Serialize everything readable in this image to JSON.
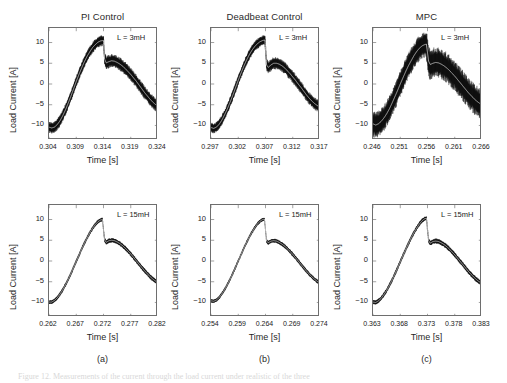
{
  "figure": {
    "caption_partial": "Figure 12. Measurements of the current through the load current under realistic of the three",
    "subcaptions": [
      "(a)",
      "(b)",
      "(c)"
    ],
    "axis_labels": {
      "x": "Time [s]",
      "y": "Load Current [A]"
    },
    "column_titles": [
      "PI Control",
      "Deadbeat Control",
      "MPC"
    ]
  },
  "chart_data": [
    {
      "id": "pi-3mh",
      "type": "line",
      "title": "PI Control",
      "annotation": "L = 3mH",
      "xlabel": "Time [s]",
      "ylabel": "Load Current [A]",
      "xlim": [
        0.304,
        0.324
      ],
      "ylim": [
        -13.5,
        13.5
      ],
      "xticks": [
        0.304,
        0.309,
        0.314,
        0.319,
        0.324
      ],
      "xticklabels": [
        "0.304",
        "0.309",
        "0.314",
        "0.319",
        "0.324"
      ],
      "yticks": [
        -10,
        -5,
        0,
        5,
        10
      ],
      "yticklabels": [
        "-10",
        "-5",
        "0",
        "5",
        "10"
      ],
      "grid": false,
      "ripple_amplitude": 1.3,
      "series": [
        {
          "name": "load current",
          "x": [
            0.304,
            0.3045,
            0.305,
            0.3055,
            0.306,
            0.3065,
            0.307,
            0.3075,
            0.308,
            0.3085,
            0.309,
            0.3095,
            0.31,
            0.3105,
            0.311,
            0.3115,
            0.312,
            0.3125,
            0.313,
            0.3135,
            0.314,
            0.3142,
            0.3145,
            0.315,
            0.3155,
            0.316,
            0.3165,
            0.317,
            0.3175,
            0.318,
            0.3185,
            0.319,
            0.3195,
            0.32,
            0.3205,
            0.321,
            0.3215,
            0.322,
            0.3225,
            0.323,
            0.3235,
            0.324
          ],
          "y": [
            -10.4,
            -10.6,
            -10.4,
            -9.8,
            -8.9,
            -7.7,
            -6.3,
            -4.7,
            -3.0,
            -1.2,
            0.6,
            2.3,
            3.9,
            5.4,
            6.7,
            7.8,
            8.8,
            9.5,
            10.1,
            10.4,
            10.5,
            6.0,
            5.1,
            5.4,
            5.6,
            5.5,
            5.2,
            4.8,
            4.3,
            3.7,
            3.0,
            2.3,
            1.5,
            0.7,
            -0.2,
            -1.1,
            -2.0,
            -2.8,
            -3.6,
            -4.3,
            -4.9,
            -5.4
          ]
        }
      ]
    },
    {
      "id": "deadbeat-3mh",
      "type": "line",
      "title": "Deadbeat Control",
      "annotation": "L = 3mH",
      "xlabel": "Time [s]",
      "ylabel": "Load Current [A]",
      "xlim": [
        0.297,
        0.317
      ],
      "ylim": [
        -13.5,
        13.5
      ],
      "xticks": [
        0.297,
        0.302,
        0.307,
        0.312,
        0.317
      ],
      "xticklabels": [
        "0.297",
        "0.302",
        "0.307",
        "0.312",
        "0.317"
      ],
      "yticks": [
        -10,
        -5,
        0,
        5,
        10
      ],
      "yticklabels": [
        "-10",
        "-5",
        "0",
        "5",
        "10"
      ],
      "grid": false,
      "ripple_amplitude": 1.2,
      "series": [
        {
          "name": "load current",
          "x": [
            0.297,
            0.2975,
            0.298,
            0.2985,
            0.299,
            0.2995,
            0.3,
            0.3005,
            0.301,
            0.3015,
            0.302,
            0.3025,
            0.303,
            0.3035,
            0.304,
            0.3045,
            0.305,
            0.3055,
            0.306,
            0.3065,
            0.3069,
            0.3072,
            0.3075,
            0.308,
            0.3085,
            0.309,
            0.3095,
            0.31,
            0.3105,
            0.311,
            0.3115,
            0.312,
            0.3125,
            0.313,
            0.3135,
            0.314,
            0.3145,
            0.315,
            0.3155,
            0.316,
            0.3165,
            0.317
          ],
          "y": [
            -10.5,
            -10.7,
            -10.4,
            -9.7,
            -8.7,
            -7.4,
            -6.0,
            -4.4,
            -2.7,
            -0.9,
            0.9,
            2.6,
            4.2,
            5.7,
            7.0,
            8.1,
            9.0,
            9.7,
            10.2,
            10.5,
            10.6,
            4.6,
            4.0,
            4.6,
            5.0,
            5.0,
            4.8,
            4.4,
            3.9,
            3.2,
            2.5,
            1.7,
            0.9,
            0.0,
            -0.8,
            -1.7,
            -2.6,
            -3.4,
            -4.1,
            -4.7,
            -5.2,
            -5.5
          ]
        }
      ]
    },
    {
      "id": "mpc-3mh",
      "type": "line",
      "title": "MPC",
      "annotation": "L = 3mH",
      "xlabel": "Time [s]",
      "ylabel": "Load Current [A]",
      "xlim": [
        0.246,
        0.266
      ],
      "ylim": [
        -13.5,
        13.5
      ],
      "xticks": [
        0.246,
        0.251,
        0.256,
        0.261,
        0.266
      ],
      "xticklabels": [
        "0.246",
        "0.251",
        "0.256",
        "0.261",
        "0.266"
      ],
      "yticks": [
        -10,
        -5,
        0,
        5,
        10
      ],
      "yticklabels": [
        "-10",
        "-5",
        "0",
        "5",
        "10"
      ],
      "grid": false,
      "ripple_amplitude": 3.0,
      "series": [
        {
          "name": "load current",
          "x": [
            0.246,
            0.2465,
            0.247,
            0.2475,
            0.248,
            0.2485,
            0.249,
            0.2495,
            0.25,
            0.2505,
            0.251,
            0.2515,
            0.252,
            0.2525,
            0.253,
            0.2535,
            0.254,
            0.2545,
            0.255,
            0.2555,
            0.2558,
            0.2562,
            0.2565,
            0.257,
            0.2575,
            0.258,
            0.2585,
            0.259,
            0.2595,
            0.26,
            0.2605,
            0.261,
            0.2615,
            0.262,
            0.2625,
            0.263,
            0.2635,
            0.264,
            0.2645,
            0.265,
            0.2655,
            0.266
          ],
          "y": [
            -9.6,
            -9.9,
            -9.6,
            -9.0,
            -8.2,
            -7.2,
            -6.0,
            -4.6,
            -3.1,
            -1.6,
            0.0,
            1.5,
            3.0,
            4.4,
            5.6,
            6.8,
            7.8,
            8.6,
            9.2,
            9.5,
            9.6,
            5.5,
            4.7,
            5.0,
            5.2,
            5.1,
            4.8,
            4.4,
            3.9,
            3.3,
            2.6,
            1.9,
            1.1,
            0.3,
            -0.5,
            -1.3,
            -2.1,
            -2.8,
            -3.5,
            -4.1,
            -4.6,
            -5.0
          ]
        }
      ]
    },
    {
      "id": "pi-15mh",
      "type": "line",
      "title": "PI Control",
      "annotation": "L = 15mH",
      "xlabel": "Time [s]",
      "ylabel": "Load Current [A]",
      "xlim": [
        0.262,
        0.282
      ],
      "ylim": [
        -13.5,
        13.5
      ],
      "xticks": [
        0.262,
        0.267,
        0.272,
        0.277,
        0.282
      ],
      "xticklabels": [
        "0.262",
        "0.267",
        "0.272",
        "0.277",
        "0.282"
      ],
      "yticks": [
        -10,
        -5,
        0,
        5,
        10
      ],
      "yticklabels": [
        "-10",
        "-5",
        "0",
        "5",
        "10"
      ],
      "grid": false,
      "ripple_amplitude": 0.45,
      "series": [
        {
          "name": "load current",
          "x": [
            0.262,
            0.2625,
            0.263,
            0.2635,
            0.264,
            0.2645,
            0.265,
            0.2655,
            0.266,
            0.2665,
            0.267,
            0.2675,
            0.268,
            0.2685,
            0.269,
            0.2695,
            0.27,
            0.2705,
            0.271,
            0.2715,
            0.2718,
            0.2722,
            0.2725,
            0.273,
            0.2735,
            0.274,
            0.2745,
            0.275,
            0.2755,
            0.276,
            0.2765,
            0.277,
            0.2775,
            0.278,
            0.2785,
            0.279,
            0.2795,
            0.28,
            0.2805,
            0.281,
            0.2815,
            0.282
          ],
          "y": [
            -9.9,
            -9.9,
            -9.5,
            -8.9,
            -8.0,
            -7.0,
            -5.8,
            -4.5,
            -3.1,
            -1.6,
            -0.1,
            1.4,
            2.9,
            4.3,
            5.6,
            6.8,
            7.9,
            8.8,
            9.5,
            9.9,
            10.0,
            5.1,
            4.5,
            4.9,
            5.0,
            4.9,
            4.6,
            4.2,
            3.7,
            3.1,
            2.4,
            1.7,
            0.9,
            0.1,
            -0.7,
            -1.5,
            -2.3,
            -3.0,
            -3.7,
            -4.3,
            -4.8,
            -5.1
          ]
        }
      ]
    },
    {
      "id": "deadbeat-15mh",
      "type": "line",
      "title": "Deadbeat Control",
      "annotation": "L = 15mH",
      "xlabel": "Time [s]",
      "ylabel": "Load Current [A]",
      "xlim": [
        0.254,
        0.274
      ],
      "ylim": [
        -13.5,
        13.5
      ],
      "xticks": [
        0.254,
        0.259,
        0.264,
        0.269,
        0.274
      ],
      "xticklabels": [
        "0.254",
        "0.259",
        "0.264",
        "0.269",
        "0.274"
      ],
      "yticks": [
        -10,
        -5,
        0,
        5,
        10
      ],
      "yticklabels": [
        "-10",
        "-5",
        "0",
        "5",
        "10"
      ],
      "grid": false,
      "ripple_amplitude": 0.4,
      "series": [
        {
          "name": "load current",
          "x": [
            0.254,
            0.2545,
            0.255,
            0.2555,
            0.256,
            0.2565,
            0.257,
            0.2575,
            0.258,
            0.2585,
            0.259,
            0.2595,
            0.26,
            0.2605,
            0.261,
            0.2615,
            0.262,
            0.2625,
            0.263,
            0.2635,
            0.2638,
            0.2642,
            0.2645,
            0.265,
            0.2655,
            0.266,
            0.2665,
            0.267,
            0.2675,
            0.268,
            0.2685,
            0.269,
            0.2695,
            0.27,
            0.2705,
            0.271,
            0.2715,
            0.272,
            0.2725,
            0.273,
            0.2735,
            0.274
          ],
          "y": [
            -9.6,
            -9.7,
            -9.4,
            -8.8,
            -7.9,
            -6.9,
            -5.7,
            -4.4,
            -3.0,
            -1.5,
            0.0,
            1.5,
            3.0,
            4.4,
            5.7,
            6.9,
            8.0,
            8.9,
            9.6,
            10.0,
            10.1,
            4.8,
            4.4,
            4.8,
            4.9,
            4.8,
            4.5,
            4.1,
            3.6,
            3.0,
            2.3,
            1.6,
            0.8,
            0.0,
            -0.8,
            -1.6,
            -2.4,
            -3.1,
            -3.8,
            -4.4,
            -4.9,
            -5.2
          ]
        }
      ]
    },
    {
      "id": "mpc-15mh",
      "type": "line",
      "title": "MPC",
      "annotation": "L = 15mH",
      "xlabel": "Time [s]",
      "ylabel": "Load Current [A]",
      "xlim": [
        0.363,
        0.383
      ],
      "ylim": [
        -13.5,
        13.5
      ],
      "xticks": [
        0.363,
        0.368,
        0.373,
        0.378,
        0.383
      ],
      "xticklabels": [
        "0.363",
        "0.368",
        "0.373",
        "0.378",
        "0.383"
      ],
      "yticks": [
        -10,
        -5,
        0,
        5,
        10
      ],
      "yticklabels": [
        "-10",
        "-5",
        "0",
        "5",
        "10"
      ],
      "grid": false,
      "ripple_amplitude": 0.5,
      "series": [
        {
          "name": "load current",
          "x": [
            0.363,
            0.3635,
            0.364,
            0.3645,
            0.365,
            0.3655,
            0.366,
            0.3665,
            0.367,
            0.3675,
            0.368,
            0.3685,
            0.369,
            0.3695,
            0.37,
            0.3705,
            0.371,
            0.3715,
            0.372,
            0.3725,
            0.3728,
            0.3732,
            0.3735,
            0.374,
            0.3745,
            0.375,
            0.3755,
            0.376,
            0.3765,
            0.377,
            0.3775,
            0.378,
            0.3785,
            0.379,
            0.3795,
            0.38,
            0.3805,
            0.381,
            0.3815,
            0.382,
            0.3825,
            0.383
          ],
          "y": [
            -9.9,
            -10.0,
            -9.6,
            -9.0,
            -8.1,
            -7.1,
            -5.9,
            -4.6,
            -3.2,
            -1.7,
            -0.2,
            1.3,
            2.8,
            4.2,
            5.6,
            6.8,
            7.9,
            8.9,
            9.7,
            10.2,
            10.3,
            4.9,
            4.3,
            4.7,
            4.8,
            4.7,
            4.4,
            4.0,
            3.5,
            2.9,
            2.2,
            1.5,
            0.7,
            -0.1,
            -0.9,
            -1.7,
            -2.5,
            -3.2,
            -3.9,
            -4.5,
            -5.0,
            -5.3
          ]
        }
      ]
    }
  ]
}
